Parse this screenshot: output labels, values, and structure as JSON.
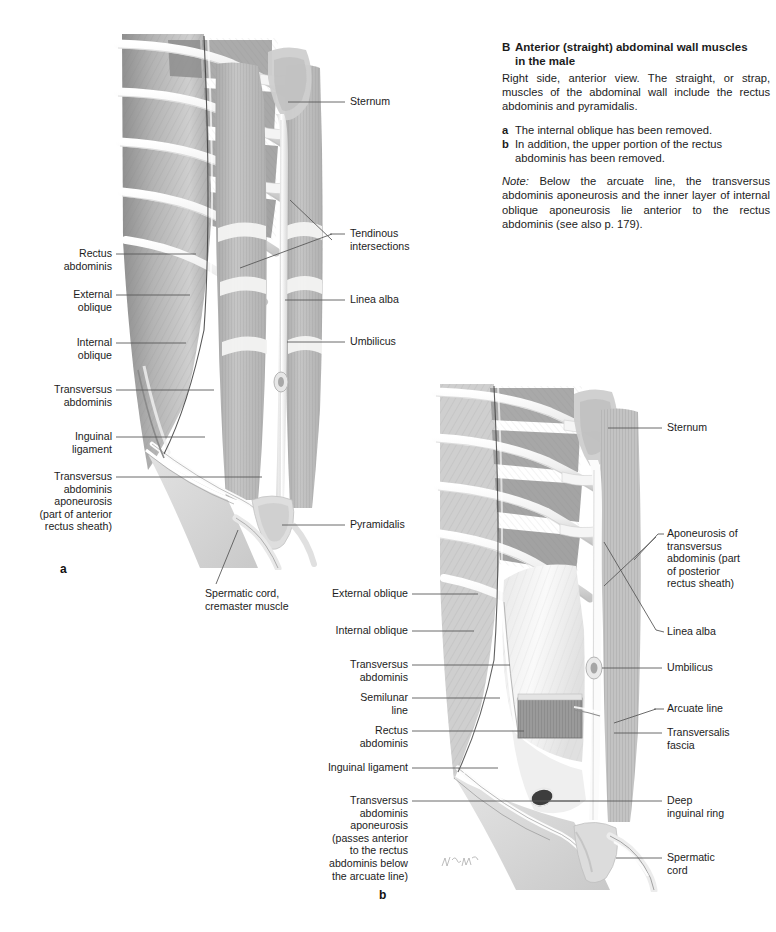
{
  "figure": {
    "id": "B",
    "title": "Anterior (straight) abdominal wall muscles in the male",
    "intro": "Right side, anterior view. The straight, or strap, muscles of the abdominal wall include the rectus abdominis and pyramidalis.",
    "items": [
      {
        "key": "a",
        "text": "The internal oblique has been removed."
      },
      {
        "key": "b",
        "text": "In addition, the upper portion of the rectus abdominis has been removed."
      }
    ],
    "note_prefix": "Note:",
    "note": " Below the arcuate line, the transversus abdominis aponeurosis and the inner layer of internal oblique aponeurosis lie anterior to the rectus abdominis (see also p. 179).",
    "panel_a_letter": "a",
    "panel_b_letter": "b"
  },
  "panel_a_labels": {
    "left": [
      {
        "name": "rectus-abdominis",
        "text": "Rectus\nabdominis"
      },
      {
        "name": "external-oblique",
        "text": "External\noblique"
      },
      {
        "name": "internal-oblique",
        "text": "Internal\noblique"
      },
      {
        "name": "transversus-abdominis",
        "text": "Transversus\nabdominis"
      },
      {
        "name": "inguinal-ligament",
        "text": "Inguinal\nligament"
      },
      {
        "name": "transversus-abdominis-aponeurosis",
        "text": "Transversus\nabdominis\naponeurosis\n(part of anterior\nrectus sheath)"
      }
    ],
    "right": [
      {
        "name": "sternum",
        "text": "Sternum"
      },
      {
        "name": "tendinous-intersections",
        "text": "Tendinous\nintersections"
      },
      {
        "name": "linea-alba",
        "text": "Linea alba"
      },
      {
        "name": "umbilicus",
        "text": "Umbilicus"
      },
      {
        "name": "pyramidalis",
        "text": "Pyramidalis"
      }
    ],
    "bottom": [
      {
        "name": "spermatic-cord-cremaster",
        "text": "Spermatic cord,\ncremaster muscle"
      }
    ]
  },
  "panel_b_labels": {
    "left": [
      {
        "name": "external-oblique",
        "text": "External oblique"
      },
      {
        "name": "internal-oblique",
        "text": "Internal oblique"
      },
      {
        "name": "transversus-abdominis",
        "text": "Transversus\nabdominis"
      },
      {
        "name": "semilunar-line",
        "text": "Semilunar\nline"
      },
      {
        "name": "rectus-abdominis",
        "text": "Rectus\nabdominis"
      },
      {
        "name": "inguinal-ligament",
        "text": "Inguinal ligament"
      },
      {
        "name": "transversus-abdominis-aponeurosis",
        "text": "Transversus\nabdominis\naponeurosis\n(passes anterior\nto the rectus\nabdominis below\nthe arcuate line)"
      }
    ],
    "right": [
      {
        "name": "sternum",
        "text": "Sternum"
      },
      {
        "name": "aponeurosis-of-transversus-abdominis",
        "text": "Aponeurosis of\ntransversus\nabdominis (part\nof posterior\nrectus sheath)"
      },
      {
        "name": "linea-alba",
        "text": "Linea alba"
      },
      {
        "name": "umbilicus",
        "text": "Umbilicus"
      },
      {
        "name": "arcuate-line",
        "text": "Arcuate line"
      },
      {
        "name": "transversalis-fascia",
        "text": "Transversalis\nfascia"
      },
      {
        "name": "deep-inguinal-ring",
        "text": "Deep\ninguinal ring"
      },
      {
        "name": "spermatic-cord",
        "text": "Spermatic\ncord"
      }
    ]
  },
  "colors": {
    "text": "#1c1c1c",
    "leader": "#5a5a5a",
    "muscle_mid": "#b9b9b9",
    "muscle_dark": "#8d8d8d",
    "tendon_light": "#f0f0ef",
    "skin_light": "#d8d8d8",
    "background": "#ffffff"
  }
}
